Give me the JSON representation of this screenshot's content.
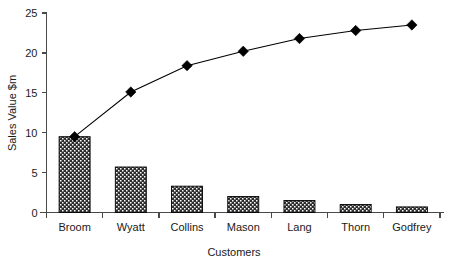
{
  "chart_data": {
    "type": "bar",
    "title": "",
    "subtitle": "",
    "xlabel": "Customers",
    "ylabel": "Sales Value $m",
    "categories": [
      "Broom",
      "Wyatt",
      "Collins",
      "Mason",
      "Lang",
      "Thorn",
      "Godfrey"
    ],
    "values": [
      9.5,
      5.7,
      3.3,
      2.0,
      1.5,
      1.0,
      0.7
    ],
    "series": [
      {
        "name": "Sales Value $m",
        "type": "bar",
        "values": [
          9.5,
          5.7,
          3.3,
          2.0,
          1.5,
          1.0,
          0.7
        ]
      },
      {
        "name": "Cumulative Sales Value $m",
        "type": "line",
        "values": [
          9.5,
          15.1,
          18.4,
          20.2,
          21.8,
          22.8,
          23.5
        ]
      }
    ],
    "ylim": [
      0,
      25
    ],
    "yticks": [
      0,
      5,
      10,
      15,
      20,
      25
    ],
    "ytick_labels": [
      "0",
      "5",
      "10",
      "15",
      "20",
      "25"
    ],
    "grid": false,
    "legend": "none",
    "bar_fill": "#2e2e2e",
    "bar_pattern": "checker-dot",
    "line_color": "#000000",
    "marker": "diamond",
    "background": "#ffffff"
  },
  "axes": {
    "y_title": "Sales Value $m",
    "x_title": "Customers"
  }
}
